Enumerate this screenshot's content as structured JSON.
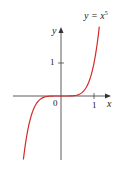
{
  "chart_data": {
    "type": "line",
    "title": "",
    "function": "y = x^5",
    "curve_label": "y = x",
    "curve_label_exponent": "5",
    "xlabel": "x",
    "ylabel": "y",
    "x_ticks": [
      {
        "value": 1,
        "label": "1"
      }
    ],
    "y_ticks": [
      {
        "value": 1,
        "label": "1"
      }
    ],
    "origin_label": "0",
    "xlim": [
      -1.45,
      1.5
    ],
    "ylim": [
      -1.9,
      2.1
    ],
    "grid": false,
    "series": [
      {
        "name": "y = x^5",
        "color": "#d42a2a",
        "x": [
          -1.14,
          -1.1,
          -1.0,
          -0.9,
          -0.8,
          -0.7,
          -0.6,
          -0.5,
          -0.4,
          -0.2,
          0,
          0.2,
          0.4,
          0.5,
          0.6,
          0.7,
          0.8,
          0.9,
          1.0,
          1.1,
          1.16
        ],
        "y": [
          -1.93,
          -1.61,
          -1.0,
          -0.59,
          -0.33,
          -0.17,
          -0.08,
          -0.03,
          -0.01,
          0.0,
          0,
          0.0,
          0.01,
          0.03,
          0.08,
          0.17,
          0.33,
          0.59,
          1.0,
          1.61,
          2.1
        ]
      }
    ]
  },
  "colors": {
    "curve": "#d42a2a",
    "axis": "#333333"
  }
}
